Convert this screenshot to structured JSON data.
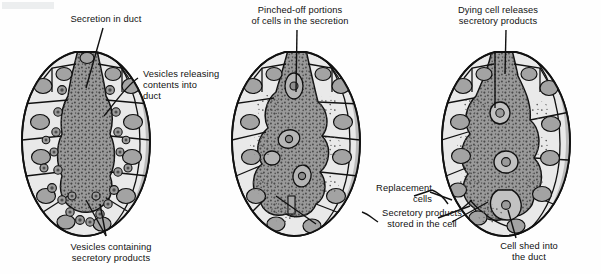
{
  "figure": {
    "background_color": "#fefefe",
    "ink_color": "#111111",
    "palette": {
      "cell_fill": "#e9e9e9",
      "cell_shade": "#bdbdbd",
      "duct_fill": "#9b9b9b",
      "nucleus_fill": "#a0a0a0",
      "granule_color": "#4a4a4a",
      "outline": "#1a1a1a"
    }
  },
  "labels": {
    "secretion_in_duct": "Secretion in duct",
    "vesicles_releasing": "Vesicles releasing\ncontents into\nduct",
    "vesicles_containing": "Vesicles containing\nsecretory products",
    "pinched_off": "Pinched-off portions\nof cells in the secretion",
    "replacement_cells": "Replacement\ncells",
    "secretory_products_stored": "Secretory products\nstored in the cell",
    "dying_cell": "Dying cell releases\nsecretory products",
    "cell_shed": "Cell shed into\nthe duct"
  },
  "panels": [
    {
      "id": "panel-merocrine",
      "position": "left",
      "labels": [
        "secretion_in_duct",
        "vesicles_releasing",
        "vesicles_containing"
      ]
    },
    {
      "id": "panel-apocrine",
      "position": "center",
      "labels": [
        "pinched_off",
        "replacement_cells",
        "secretory_products_stored"
      ]
    },
    {
      "id": "panel-holocrine",
      "position": "right",
      "labels": [
        "dying_cell",
        "cell_shed"
      ]
    }
  ]
}
